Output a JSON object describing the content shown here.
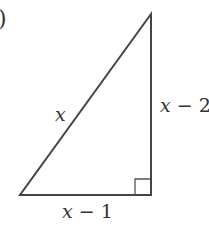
{
  "figure": {
    "label_fragment": ")",
    "shape": "right-triangle",
    "line_color": "#444444",
    "vertices": {
      "bottom_left": [
        20,
        195
      ],
      "bottom_right": [
        151,
        195
      ],
      "top": [
        151,
        14
      ]
    },
    "right_angle_marker_size": 16,
    "labels": {
      "hypotenuse": {
        "var": "x",
        "rest": ""
      },
      "vertical_leg": {
        "var": "x",
        "rest": " − 2"
      },
      "horizontal_leg": {
        "var": "x",
        "rest": " − 1"
      }
    }
  }
}
